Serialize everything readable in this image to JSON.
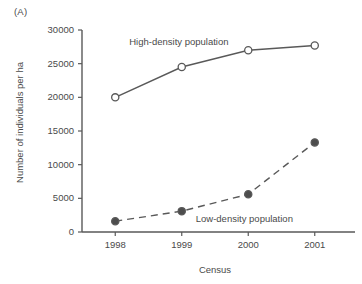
{
  "panel": {
    "label": "(A)"
  },
  "chart_data": {
    "type": "line",
    "title": "",
    "panel_label": "(A)",
    "xlabel": "Census",
    "ylabel": "Number of individuals per ha",
    "categories": [
      "1998",
      "1999",
      "2000",
      "2001"
    ],
    "x_tick_labels": [
      "1998",
      "1999",
      "2000",
      "2001"
    ],
    "y_tick_labels": [
      "0",
      "5000",
      "10000",
      "15000",
      "20000",
      "25000",
      "30000"
    ],
    "y_ticks": [
      0,
      5000,
      10000,
      15000,
      20000,
      25000,
      30000
    ],
    "ylim": [
      0,
      30000
    ],
    "grid": false,
    "legend": "inline annotations",
    "series": [
      {
        "name": "High-density population",
        "values": [
          20000,
          24500,
          27000,
          27700
        ],
        "marker": "open-circle",
        "line_style": "solid",
        "color": "#595959",
        "annotation": "High-density population"
      },
      {
        "name": "Low-density population",
        "values": [
          1600,
          3100,
          5600,
          13300
        ],
        "marker": "filled-circle",
        "line_style": "dashed",
        "color": "#595959",
        "annotation": "Low-density population"
      }
    ],
    "annotations": [
      {
        "text": "High-density population",
        "x": 1998.6,
        "y": 28200
      },
      {
        "text": "Low-density population",
        "x": 1999.75,
        "y": 1900
      }
    ]
  },
  "colors": {
    "line": "#595959",
    "axis": "#595959",
    "text": "#4a4a4a",
    "background": "#ffffff",
    "marker_fill_open": "#ffffff",
    "marker_fill_closed": "#4d4d4d"
  }
}
